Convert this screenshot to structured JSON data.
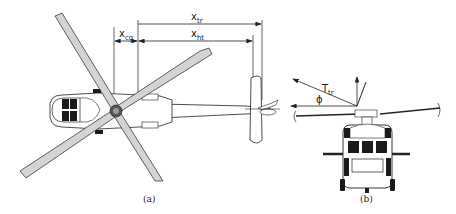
{
  "figure": {
    "panel_a": {
      "caption": "(a)",
      "view": "top view",
      "dimensions": [
        {
          "base": "x",
          "sub": "tr"
        },
        {
          "base": "x",
          "sub": "ht"
        },
        {
          "base": "x",
          "sub": "cg"
        }
      ]
    },
    "panel_b": {
      "caption": "(b)",
      "view": "front view",
      "force_label": {
        "base": "T",
        "sub": "tr"
      },
      "angle_label": "ϕ"
    }
  },
  "colors": {
    "stroke": "#222222",
    "blade_fill": "#d4d4d4",
    "dark_fill": "#1a1a1a",
    "background": "#ffffff"
  }
}
